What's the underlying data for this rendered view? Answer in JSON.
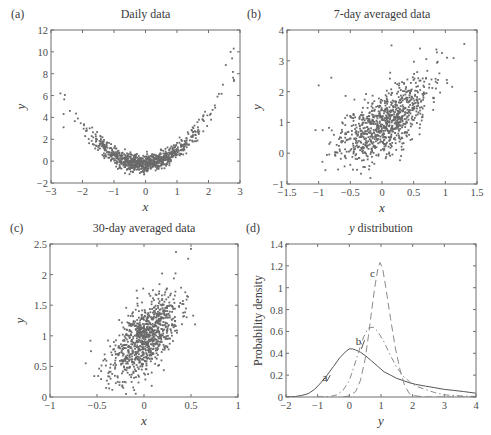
{
  "figure": {
    "panels": [
      {
        "id": "a",
        "letter": "(a)",
        "title": "Daily data",
        "box": {
          "left": 51,
          "top": 30,
          "right": 240,
          "bottom": 183
        },
        "xlabel": "x",
        "ylabel": "y",
        "xlim": [
          -3,
          3
        ],
        "ylim": [
          -2,
          12
        ],
        "xticks": [
          -3,
          -2,
          -1,
          0,
          1,
          2,
          3
        ],
        "yticks": [
          -2,
          0,
          2,
          4,
          6,
          8,
          10,
          12
        ]
      },
      {
        "id": "b",
        "letter": "(b)",
        "title": "7-day averaged data",
        "box": {
          "left": 287,
          "top": 30,
          "right": 477,
          "bottom": 184
        },
        "xlabel": "x",
        "ylabel": "y",
        "xlim": [
          -1.5,
          1.5
        ],
        "ylim": [
          -1,
          4
        ],
        "xticks": [
          -1.5,
          -1,
          -0.5,
          0,
          0.5,
          1,
          1.5
        ],
        "yticks": [
          -1,
          0,
          1,
          2,
          3,
          4
        ]
      },
      {
        "id": "c",
        "letter": "(c)",
        "title": "30-day averaged data",
        "box": {
          "left": 50,
          "top": 244,
          "right": 238,
          "bottom": 397
        },
        "xlabel": "x",
        "ylabel": "y",
        "xlim": [
          -1,
          1
        ],
        "ylim": [
          0,
          2.5
        ],
        "xticks": [
          -1,
          -0.5,
          0,
          0.5,
          1
        ],
        "yticks": [
          0,
          0.5,
          1,
          1.5,
          2,
          2.5
        ]
      },
      {
        "id": "d",
        "letter": "(d)",
        "title": "y distribution",
        "box": {
          "left": 286,
          "top": 244,
          "right": 476,
          "bottom": 397
        },
        "xlabel": "y",
        "ylabel": "Probability density",
        "xlim": [
          -2,
          4
        ],
        "ylim": [
          0,
          1.4
        ],
        "xticks": [
          -2,
          -1,
          0,
          1,
          2,
          3,
          4
        ],
        "yticks": [
          0,
          0.2,
          0.4,
          0.6,
          0.8,
          1,
          1.2,
          1.4
        ]
      }
    ]
  },
  "chart_data": [
    {
      "type": "scatter",
      "panel": "(a)",
      "title": "Daily data",
      "xlabel": "x",
      "ylabel": "y",
      "xlim": [
        -3,
        3
      ],
      "ylim": [
        -2,
        12
      ],
      "grid": false,
      "description": "Quadratic relationship, approx y = x^2 + x*0 - 0.2 with noise; minimum near x = -0.5, y ~ -0.3; max point near (2.8, 10.3)",
      "generator": {
        "n": 900,
        "seed": 7,
        "x_mean": 0,
        "x_sd": 0.9,
        "model": "y = x^2 + 0.2*x - 0.25 + noise",
        "noise_sd": 0.45
      },
      "notable_points": [
        [
          -2.6,
          4.3
        ],
        [
          -2.6,
          3.1
        ],
        [
          -2.4,
          4.6
        ],
        [
          2.55,
          8.8
        ],
        [
          2.7,
          10.0
        ],
        [
          2.8,
          10.3
        ],
        [
          2.75,
          9.4
        ]
      ]
    },
    {
      "type": "scatter",
      "panel": "(b)",
      "title": "7-day averaged data",
      "xlabel": "x",
      "ylabel": "y",
      "xlim": [
        -1.5,
        1.5
      ],
      "ylim": [
        -1,
        4
      ],
      "grid": false,
      "description": "Positively correlated cloud centered near (0, 0.9)",
      "generator": {
        "n": 900,
        "seed": 11,
        "x_mean": 0.05,
        "x_sd": 0.35,
        "model": "y = 0.9 + 1.2*x + 0.6*x^2 + noise",
        "noise_sd": 0.5
      },
      "notable_points": [
        [
          1.3,
          3.55
        ],
        [
          0.15,
          3.5
        ],
        [
          0.6,
          3.4
        ],
        [
          -1.0,
          2.2
        ],
        [
          -0.8,
          2.45
        ],
        [
          -1.05,
          0.75
        ],
        [
          -0.27,
          -0.45
        ]
      ]
    },
    {
      "type": "scatter",
      "panel": "(c)",
      "title": "30-day averaged data",
      "xlabel": "x",
      "ylabel": "y",
      "xlim": [
        -1,
        1
      ],
      "ylim": [
        0,
        2.5
      ],
      "grid": false,
      "description": "Positively correlated elliptical cloud centered near (0, 0.95)",
      "generator": {
        "n": 900,
        "seed": 23,
        "x_mean": 0.0,
        "x_sd": 0.18,
        "model": "y = 0.95 + 1.1*x + noise",
        "noise_sd": 0.27
      },
      "notable_points": [
        [
          -0.62,
          0.55
        ],
        [
          -0.57,
          0.92
        ],
        [
          0.34,
          2.37
        ],
        [
          0.5,
          2.42
        ],
        [
          0.47,
          2.26
        ],
        [
          -0.22,
          0.15
        ],
        [
          -0.37,
          0.14
        ]
      ]
    },
    {
      "type": "line",
      "panel": "(d)",
      "title": "y distribution",
      "xlabel": "y",
      "ylabel": "Probability density",
      "xlim": [
        -2,
        4
      ],
      "ylim": [
        0,
        1.4
      ],
      "grid": false,
      "series": [
        {
          "name": "a",
          "style": "solid",
          "x": [
            -2,
            -1.7,
            -1.5,
            -1.3,
            -1.1,
            -0.9,
            -0.7,
            -0.5,
            -0.3,
            -0.1,
            0.0,
            0.1,
            0.2,
            0.35,
            0.5,
            0.7,
            0.9,
            1.1,
            1.3,
            1.5,
            1.7,
            1.9,
            2.1,
            2.4,
            2.7,
            3.0,
            3.3,
            3.6,
            4.0
          ],
          "y": [
            0.0,
            0.005,
            0.015,
            0.03,
            0.07,
            0.13,
            0.2,
            0.28,
            0.36,
            0.42,
            0.44,
            0.44,
            0.43,
            0.41,
            0.38,
            0.33,
            0.28,
            0.23,
            0.2,
            0.17,
            0.15,
            0.13,
            0.115,
            0.1,
            0.085,
            0.07,
            0.06,
            0.05,
            0.035
          ]
        },
        {
          "name": "b",
          "style": "dash-dot",
          "x": [
            -1.0,
            -0.6,
            -0.4,
            -0.2,
            0.0,
            0.15,
            0.3,
            0.45,
            0.6,
            0.75,
            0.9,
            1.1,
            1.3,
            1.5,
            1.7,
            1.9,
            2.1,
            2.4,
            2.7,
            3.0,
            3.5,
            4.0
          ],
          "y": [
            0.0,
            0.005,
            0.02,
            0.06,
            0.15,
            0.28,
            0.42,
            0.55,
            0.63,
            0.64,
            0.6,
            0.5,
            0.38,
            0.27,
            0.19,
            0.14,
            0.1,
            0.07,
            0.04,
            0.02,
            0.01,
            0.005
          ]
        },
        {
          "name": "c",
          "style": "dashed",
          "x": [
            -0.2,
            0.0,
            0.2,
            0.35,
            0.5,
            0.6,
            0.7,
            0.8,
            0.9,
            0.97,
            1.05,
            1.15,
            1.3,
            1.45,
            1.6,
            1.75,
            1.9,
            2.1,
            2.4,
            2.8,
            3.2,
            4.0
          ],
          "y": [
            0.0,
            0.01,
            0.05,
            0.15,
            0.35,
            0.55,
            0.78,
            1.0,
            1.17,
            1.23,
            1.18,
            1.0,
            0.72,
            0.45,
            0.25,
            0.1,
            0.03,
            0.01,
            0.0,
            0.0,
            0.0,
            0.0
          ]
        }
      ],
      "annotations": [
        {
          "text": "a",
          "x": -0.85,
          "y": 0.15
        },
        {
          "text": "b",
          "x": 0.2,
          "y": 0.48
        },
        {
          "text": "c",
          "x": 0.65,
          "y": 1.1
        }
      ]
    }
  ]
}
